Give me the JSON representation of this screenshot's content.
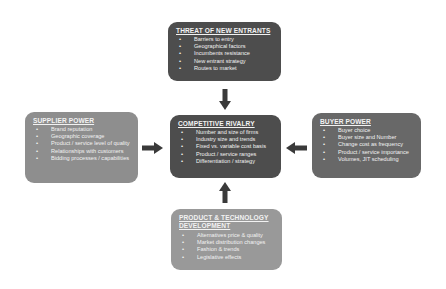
{
  "diagram": {
    "colors": {
      "background": "#ffffff",
      "threat_box": "#4d4d4d",
      "rivalry_box": "#4d4d4d",
      "buyer_box": "#686868",
      "supplier_box": "#8e8e8e",
      "product_box": "#999999",
      "arrow": "#3a3a3a",
      "text": "#f2f2f2"
    },
    "boxes": {
      "threat": {
        "title": "THREAT OF NEW ENTRANTS",
        "items": [
          "Barriers to entry",
          "Geographical factors",
          "Incumbents resistance",
          "New entrant strategy",
          "Routes to market"
        ]
      },
      "supplier": {
        "title": "SUPPLIER POWER",
        "items": [
          "Brand reputation",
          "Geographic coverage",
          "Product / service level of quality",
          "Relationships with customers",
          "Bidding processes / capabilities"
        ]
      },
      "rivalry": {
        "title": "COMPETITIVE RIVALRY",
        "items": [
          "Number and size of firms",
          "Industry size and trends",
          "Fixed vs. variable cost basis",
          "Product / service ranges",
          "Differentiation / strategy"
        ]
      },
      "buyer": {
        "title": "BUYER POWER",
        "items": [
          "Buyer choice",
          "Buyer size and Number",
          "Change cost as frequency",
          "Product / service importance",
          "Volumes, JIT scheduling"
        ]
      },
      "product": {
        "title": "PRODUCT & TECHNOLOGY\nDEVELOPMENT",
        "items": [
          "Alternatives price & quality",
          "Market distribution changes",
          "Fashion & trends",
          "Legislative effects"
        ]
      }
    },
    "bullet": "•",
    "arrows": [
      {
        "from": "threat",
        "to": "rivalry",
        "direction": "down"
      },
      {
        "from": "supplier",
        "to": "rivalry",
        "direction": "right"
      },
      {
        "from": "buyer",
        "to": "rivalry",
        "direction": "left"
      },
      {
        "from": "product",
        "to": "rivalry",
        "direction": "up"
      }
    ]
  }
}
